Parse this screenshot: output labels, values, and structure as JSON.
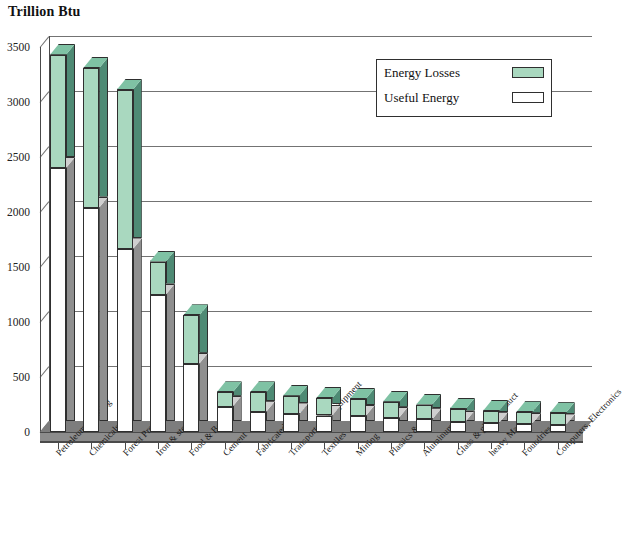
{
  "chart_data": {
    "type": "bar",
    "title": "Trillion Btu",
    "subtitle": "",
    "xlabel": "",
    "ylabel": "Trillion Btu",
    "ylim": [
      0,
      3500
    ],
    "ytick_step": 500,
    "yticks": [
      "0",
      "500",
      "1000",
      "1500",
      "2000",
      "2500",
      "3000",
      "3500"
    ],
    "grid": true,
    "stacked": true,
    "legend_position": "top-right",
    "categories": [
      "Petroleum Refining",
      "Chemicals",
      "Forest Products",
      "Iron & steel",
      "Food & Beverage",
      "Cement",
      "Fabricated Metals",
      "Transportation Equipment",
      "Textiles",
      "Mining",
      "Plastics & Rubber",
      "Aluminum",
      "Glass & glass Product",
      "heavy Machinery",
      "Foundries",
      "Computers, Electronics"
    ],
    "series": [
      {
        "name": "Useful Energy",
        "color": "#ffffff",
        "values": [
          2400,
          2040,
          1660,
          1250,
          620,
          230,
          180,
          160,
          150,
          145,
          130,
          115,
          95,
          80,
          75,
          60
        ]
      },
      {
        "name": "Energy Losses",
        "color": "#a9d8bf",
        "values": [
          1030,
          1270,
          1450,
          300,
          440,
          130,
          180,
          170,
          160,
          155,
          145,
          135,
          115,
          110,
          105,
          110
        ]
      }
    ],
    "totals": [
      3430,
      3310,
      3110,
      1550,
      1060,
      360,
      360,
      330,
      310,
      300,
      275,
      250,
      210,
      190,
      180,
      170
    ]
  },
  "legend": {
    "items": [
      {
        "label": "Energy Losses",
        "swatch": "loss"
      },
      {
        "label": "Useful Energy",
        "swatch": "use"
      }
    ]
  },
  "colors": {
    "loss_front": "#a9d8bf",
    "loss_side": "#4e8a74",
    "loss_top": "#7fc2a4",
    "use_front": "#ffffff",
    "use_side": "#8f8f8f",
    "axis": "#4a4a4a",
    "floor": "#8c8c8c"
  }
}
